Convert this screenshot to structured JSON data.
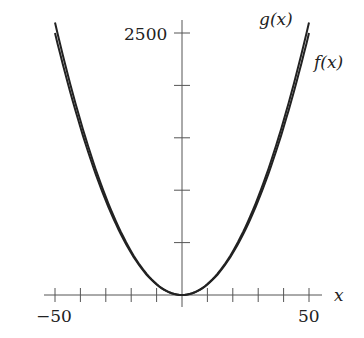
{
  "chart_data": {
    "type": "line",
    "title": "",
    "xlabel": "x",
    "ylabel": "",
    "xlim": [
      -50,
      50
    ],
    "ylim": [
      0,
      2500
    ],
    "x_ticks_step": 10,
    "y_ticks_step": 500,
    "x_tick_labels": [
      "-50",
      "50"
    ],
    "y_tick_labels": [
      "2500"
    ],
    "grid": false,
    "series": [
      {
        "name": "g(x)",
        "x": [
          -50,
          -40,
          -30,
          -20,
          -10,
          0,
          10,
          20,
          30,
          40,
          50
        ],
        "values": [
          2600,
          1700,
          1000,
          500,
          200,
          100,
          200,
          500,
          1000,
          1700,
          2600
        ]
      },
      {
        "name": "f(x)",
        "x": [
          -50,
          -40,
          -30,
          -20,
          -10,
          0,
          10,
          20,
          30,
          40,
          50
        ],
        "values": [
          2500,
          1600,
          900,
          400,
          100,
          0,
          100,
          400,
          900,
          1600,
          2500
        ]
      }
    ]
  },
  "labels": {
    "x_axis": "x",
    "y_top": "2500",
    "x_left": "−50",
    "x_right": "50",
    "g": "g(x)",
    "f": "f(x)"
  }
}
